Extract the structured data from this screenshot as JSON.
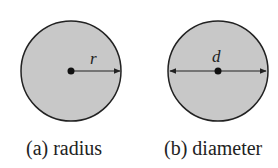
{
  "figures": [
    {
      "id": "radius",
      "symbol": "r",
      "caption": "(a) radius"
    },
    {
      "id": "diameter",
      "symbol": "d",
      "caption": "(b) diameter"
    }
  ],
  "colors": {
    "fill": "#c8c8c8",
    "stroke": "#222222"
  }
}
